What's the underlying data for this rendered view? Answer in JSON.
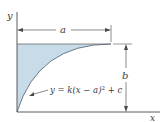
{
  "diagram": {
    "type": "area-under-curve",
    "axes": {
      "x_label": "x",
      "y_label": "y"
    },
    "dimensions": {
      "width_label": "a",
      "height_label": "b"
    },
    "curve": {
      "equation": "y = k(x − a)² + c",
      "equation_parts": {
        "lhs": "y = k(x − a)",
        "exponent": "2",
        "rhs": " + c"
      }
    },
    "colors": {
      "fill": "#c8dbe8",
      "stroke": "#4a4a4a",
      "background": "#ffffff"
    }
  }
}
